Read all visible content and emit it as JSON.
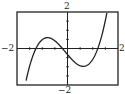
{
  "chart_data": {
    "type": "line",
    "title": "",
    "xlabel": "",
    "ylabel": "",
    "xlim": [
      -2,
      2
    ],
    "ylim": [
      -2,
      2
    ],
    "grid": false,
    "legend": null,
    "tick_labels": {
      "x_min": "−2",
      "x_max": "2",
      "y_min": "−2",
      "y_max": "2"
    },
    "series": [
      {
        "name": "cubic",
        "function": "y = 1.1(x+1.25)(x+0.2)(x-1.2)",
        "x": [
          -1.64,
          -1.5,
          -1.25,
          -1.0,
          -0.77,
          -0.5,
          -0.2,
          0.0,
          0.4,
          0.78,
          1.0,
          1.2,
          1.4,
          1.56
        ],
        "y": [
          -1.76,
          -0.98,
          0.0,
          0.44,
          0.59,
          0.43,
          0.0,
          -0.33,
          -0.8,
          -0.95,
          -0.79,
          0.0,
          0.93,
          1.94
        ]
      }
    ],
    "axes": {
      "x_axis_at_y": 0,
      "y_axis_at_x": 0,
      "frame": true
    }
  }
}
